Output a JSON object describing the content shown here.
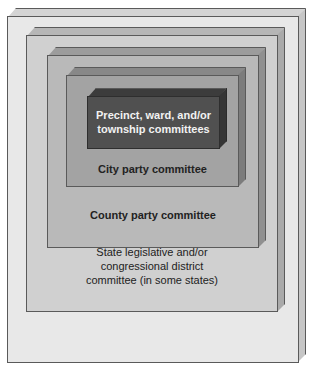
{
  "diagram": {
    "levels": [
      {
        "label": "State central committee",
        "face_color": "#e6e6e6",
        "top_color": "#d2d2d2",
        "side_color": "#c4c4c4"
      },
      {
        "label": "State legislative and/or\ncongressional district\ncommittee (in some states)",
        "line1": "State legislative and/or",
        "line2": "congressional district",
        "line3": "committee (in some states)",
        "face_color": "#cfcfcf",
        "top_color": "#b4b4b4",
        "side_color": "#a8a8a8"
      },
      {
        "label": "County party committee",
        "face_color": "#b8b8b8",
        "top_color": "#9a9a9a",
        "side_color": "#8e8e8e"
      },
      {
        "label": "City party committee",
        "face_color": "#a2a2a2",
        "top_color": "#868686",
        "side_color": "#7a7a7a"
      },
      {
        "label": "Precinct, ward, and/or\ntownship committees",
        "line1": "Precinct, ward, and/or",
        "line2": "township committees",
        "face_color": "#4e4e4e",
        "top_color": "#3a3a3a",
        "side_color": "#333333",
        "text_color": "#f2f2f2"
      }
    ]
  }
}
